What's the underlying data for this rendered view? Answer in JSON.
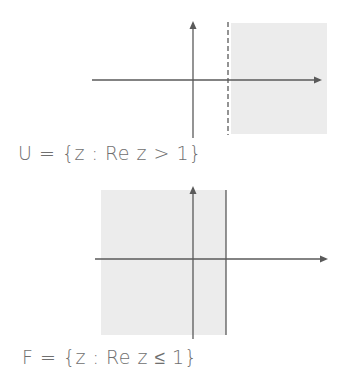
{
  "colors": {
    "axis": "#5a5a5a",
    "shade": "#ececec",
    "text": "#6f6f6f",
    "background": "#ffffff"
  },
  "diagrams": [
    {
      "id": "U",
      "caption": "U = {z : Re z > 1}",
      "description": "Open half-plane to the right of the dashed line Re z = 1 (shaded), boundary not included",
      "boundary_style": "dashed",
      "shaded_side": "right"
    },
    {
      "id": "F",
      "caption": "F = {z : Re z ≤ 1}",
      "description": "Closed half-plane to the left of the solid line Re z = 1 (shaded), boundary included",
      "boundary_style": "solid",
      "shaded_side": "left"
    }
  ]
}
